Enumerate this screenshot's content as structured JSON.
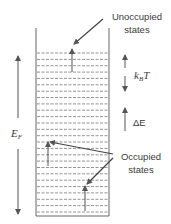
{
  "diagram": {
    "colors": {
      "line": "#555555",
      "text": "#3a3a3a",
      "background": "#ffffff"
    },
    "well": {
      "level_count": 26,
      "level_style": "dashed"
    },
    "labels": {
      "unoccupied_line1": "Unoccupied",
      "unoccupied_line2": "states",
      "occupied_line1": "Occupied",
      "occupied_line2": "states",
      "kbt_main": "k",
      "kbt_sub": "B",
      "kbt_tail": "T",
      "delta_e": "ΔE",
      "fermi_main": "E",
      "fermi_sub": "F"
    }
  }
}
